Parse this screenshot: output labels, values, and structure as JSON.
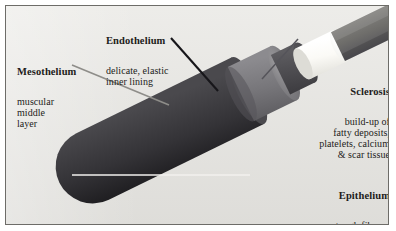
{
  "figure": {
    "width": 396,
    "height": 231,
    "panel_background": "#e8e7e3",
    "panel_border_color": "#6d6c68"
  },
  "labels": [
    {
      "id": "mesothelium",
      "title": "Mesothelium",
      "desc": "muscular\nmiddle\nlayer",
      "align": "left",
      "leader_color": "#8e8d89"
    },
    {
      "id": "endothelium",
      "title": "Endothelium",
      "desc": "delicate, elastic\ninner lining",
      "align": "left",
      "leader_color": "#17161a"
    },
    {
      "id": "sclerosis",
      "title": "Sclerosis",
      "desc": "build-up of\nfatty deposits,\nplatelets, calcium\n& scar tissue",
      "align": "right",
      "leader_color": "#55545a"
    },
    {
      "id": "epithelium",
      "title": "Epithelium",
      "desc": "tough fibrous\ncoating",
      "align": "right",
      "leader_color": "#f2f1ee"
    }
  ],
  "anatomy": {
    "layers": [
      {
        "name": "epithelium-outer-wall",
        "color": "#2f2e31"
      },
      {
        "name": "mesothelium-muscular-layer",
        "color": "#6f6e72"
      },
      {
        "name": "mesothelium-inner-shade",
        "color": "#49484c"
      },
      {
        "name": "endothelium-inner-lining",
        "color": "#f7f6f2"
      },
      {
        "name": "sclerosis-plaque-ring",
        "color": "#8a8986"
      },
      {
        "name": "sclerosis-occluded-lumen",
        "color": "#17161a"
      }
    ]
  }
}
